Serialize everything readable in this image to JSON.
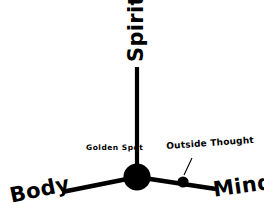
{
  "diagram": {
    "background_color": "#ffffff",
    "ink_color": "#000000",
    "axes": [
      {
        "id": "spirit",
        "label": "Spirit",
        "direction": "up",
        "rotation_deg": -90
      },
      {
        "id": "body",
        "label": "Body",
        "direction": "down-left",
        "rotation_deg": -12
      },
      {
        "id": "mind",
        "label": "Mind",
        "direction": "down-right",
        "rotation_deg": -8
      }
    ],
    "nodes": [
      {
        "id": "golden-spot",
        "label": "Golden Spot",
        "type": "hub",
        "cx": 137,
        "cy": 177,
        "r": 13.5
      },
      {
        "id": "outside-thought",
        "label": "Outside Thought",
        "type": "point",
        "cx": 183,
        "cy": 182,
        "r": 5.5
      }
    ],
    "leader_line": {
      "from_label": "Outside Thought",
      "to_node": "outside-thought"
    }
  }
}
